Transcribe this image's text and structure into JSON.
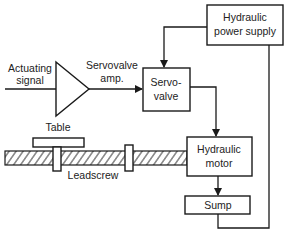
{
  "diagram": {
    "type": "block-diagram",
    "colors": {
      "line": "#1a1a1a",
      "text": "#222222",
      "background": "#ffffff"
    },
    "labels": {
      "actuating_signal_1": "Actuating",
      "actuating_signal_2": "signal",
      "amp_1": "Servovalve",
      "amp_2": "amp.",
      "servovalve_1": "Servo-",
      "servovalve_2": "valve",
      "power_supply_1": "Hydraulic",
      "power_supply_2": "power supply",
      "motor_1": "Hydraulic",
      "motor_2": "motor",
      "sump": "Sump",
      "table": "Table",
      "leadscrew": "Leadscrew"
    },
    "nodes": [
      {
        "id": "actuating-signal",
        "label": "Actuating signal",
        "kind": "input"
      },
      {
        "id": "servovalve-amp",
        "label": "Servovalve amp.",
        "kind": "amplifier-triangle"
      },
      {
        "id": "servovalve",
        "label": "Servo-valve",
        "kind": "box"
      },
      {
        "id": "hydraulic-power-supply",
        "label": "Hydraulic power supply",
        "kind": "box"
      },
      {
        "id": "hydraulic-motor",
        "label": "Hydraulic motor",
        "kind": "box"
      },
      {
        "id": "sump",
        "label": "Sump",
        "kind": "box"
      },
      {
        "id": "table",
        "label": "Table",
        "kind": "mechanical"
      },
      {
        "id": "leadscrew",
        "label": "Leadscrew",
        "kind": "mechanical"
      }
    ],
    "edges": [
      {
        "from": "actuating-signal",
        "to": "servovalve-amp"
      },
      {
        "from": "servovalve-amp",
        "to": "servovalve",
        "arrow": true
      },
      {
        "from": "hydraulic-power-supply",
        "to": "servovalve",
        "arrow": true
      },
      {
        "from": "servovalve",
        "to": "hydraulic-motor",
        "arrow": true
      },
      {
        "from": "hydraulic-motor",
        "to": "sump",
        "arrow": true
      },
      {
        "from": "sump",
        "to": "hydraulic-power-supply"
      },
      {
        "from": "hydraulic-motor",
        "to": "leadscrew"
      },
      {
        "from": "leadscrew",
        "to": "table"
      }
    ]
  }
}
